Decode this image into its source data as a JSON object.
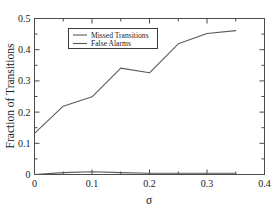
{
  "chart_data": {
    "type": "line",
    "title": "",
    "xlabel": "σ",
    "ylabel": "Fraction of Transitions",
    "xlim": [
      0,
      0.4
    ],
    "ylim": [
      0,
      0.5
    ],
    "xticks": [
      0,
      0.1,
      0.2,
      0.3,
      0.4
    ],
    "xtick_labels": [
      "0",
      "0.1",
      "0.2",
      "0.3",
      "0.4"
    ],
    "xminor_ticks": [
      0.05,
      0.15,
      0.25,
      0.35
    ],
    "yticks": [
      0,
      0.1,
      0.2,
      0.3,
      0.4,
      0.5
    ],
    "ytick_labels": [
      "0",
      "0.1",
      "0.2",
      "0.3",
      "0.4",
      "0.5"
    ],
    "yminor_ticks": [
      0.05,
      0.15,
      0.25,
      0.35,
      0.45
    ],
    "grid": false,
    "legend_position": "upper center",
    "x": [
      0,
      0.05,
      0.1,
      0.15,
      0.2,
      0.25,
      0.3,
      0.35
    ],
    "series": [
      {
        "name": "Missed Transitions",
        "color": "#5a5a5a",
        "values": [
          0.132,
          0.219,
          0.249,
          0.341,
          0.326,
          0.419,
          0.452,
          0.461
        ]
      },
      {
        "name": "False Alarms",
        "color": "#5a5a5a",
        "values": [
          0.0,
          0.006,
          0.009,
          0.006,
          0.004,
          0.004,
          0.004,
          0.004
        ]
      }
    ]
  },
  "legend": {
    "entries": [
      {
        "label": "Missed Transitions"
      },
      {
        "label": "False Alarms"
      }
    ]
  },
  "axes": {
    "x_title": "σ",
    "y_title": "Fraction of Transitions"
  },
  "colors": {
    "line": "#5a5a5a",
    "frame": "#4a4a4a",
    "text": "#1a1a1a",
    "background": "#ffffff"
  }
}
